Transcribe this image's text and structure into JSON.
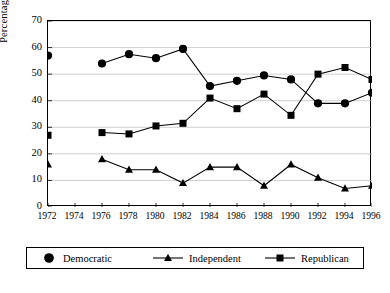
{
  "chart_data": {
    "type": "line",
    "title": "",
    "xlabel": "",
    "ylabel": "Percentage",
    "x": [
      1972,
      1974,
      1976,
      1978,
      1980,
      1982,
      1984,
      1986,
      1988,
      1990,
      1992,
      1994,
      1996
    ],
    "xtick_labels": [
      "1972",
      "1974",
      "1976",
      "1978",
      "1980",
      "1982",
      "1984",
      "1986",
      "1988",
      "1990",
      "1992",
      "1994",
      "1996"
    ],
    "ytick_labels": [
      "0",
      "10",
      "20",
      "30",
      "40",
      "50",
      "60",
      "70"
    ],
    "yticks": [
      0,
      10,
      20,
      30,
      40,
      50,
      60,
      70
    ],
    "xlim": [
      1972,
      1996
    ],
    "ylim": [
      0,
      70
    ],
    "grid": "horizontal",
    "legend_position": "below",
    "series": [
      {
        "name": "Democratic",
        "marker": "circle",
        "color": "#000000",
        "points": [
          {
            "x": 1972,
            "y": 57
          },
          {
            "x": 1976,
            "y": 54
          },
          {
            "x": 1978,
            "y": 57.5
          },
          {
            "x": 1980,
            "y": 56
          },
          {
            "x": 1982,
            "y": 59.5
          },
          {
            "x": 1984,
            "y": 45.5
          },
          {
            "x": 1986,
            "y": 47.5
          },
          {
            "x": 1988,
            "y": 49.5
          },
          {
            "x": 1990,
            "y": 48
          },
          {
            "x": 1992,
            "y": 39
          },
          {
            "x": 1994,
            "y": 39
          },
          {
            "x": 1996,
            "y": 43
          }
        ]
      },
      {
        "name": "Independent",
        "marker": "triangle",
        "color": "#000000",
        "points": [
          {
            "x": 1972,
            "y": 16
          },
          {
            "x": 1976,
            "y": 18
          },
          {
            "x": 1978,
            "y": 14
          },
          {
            "x": 1980,
            "y": 14
          },
          {
            "x": 1982,
            "y": 9
          },
          {
            "x": 1984,
            "y": 15
          },
          {
            "x": 1986,
            "y": 15
          },
          {
            "x": 1988,
            "y": 8
          },
          {
            "x": 1990,
            "y": 16
          },
          {
            "x": 1992,
            "y": 11
          },
          {
            "x": 1994,
            "y": 7
          },
          {
            "x": 1996,
            "y": 8
          }
        ]
      },
      {
        "name": "Republican",
        "marker": "square",
        "color": "#000000",
        "points": [
          {
            "x": 1972,
            "y": 27
          },
          {
            "x": 1976,
            "y": 28
          },
          {
            "x": 1978,
            "y": 27.5
          },
          {
            "x": 1980,
            "y": 30.5
          },
          {
            "x": 1982,
            "y": 31.5
          },
          {
            "x": 1984,
            "y": 41
          },
          {
            "x": 1986,
            "y": 37
          },
          {
            "x": 1988,
            "y": 42.5
          },
          {
            "x": 1990,
            "y": 34.5
          },
          {
            "x": 1992,
            "y": 50
          },
          {
            "x": 1994,
            "y": 52.5
          },
          {
            "x": 1996,
            "y": 48
          }
        ]
      }
    ],
    "series_gap_note": "1972 points are isolated markers; lines begin at 1976"
  },
  "legend": {
    "items": [
      {
        "label": "Democratic",
        "marker": "circle",
        "line": false
      },
      {
        "label": "Independent",
        "marker": "triangle",
        "line": true
      },
      {
        "label": "Republican",
        "marker": "square",
        "line": true
      }
    ]
  }
}
